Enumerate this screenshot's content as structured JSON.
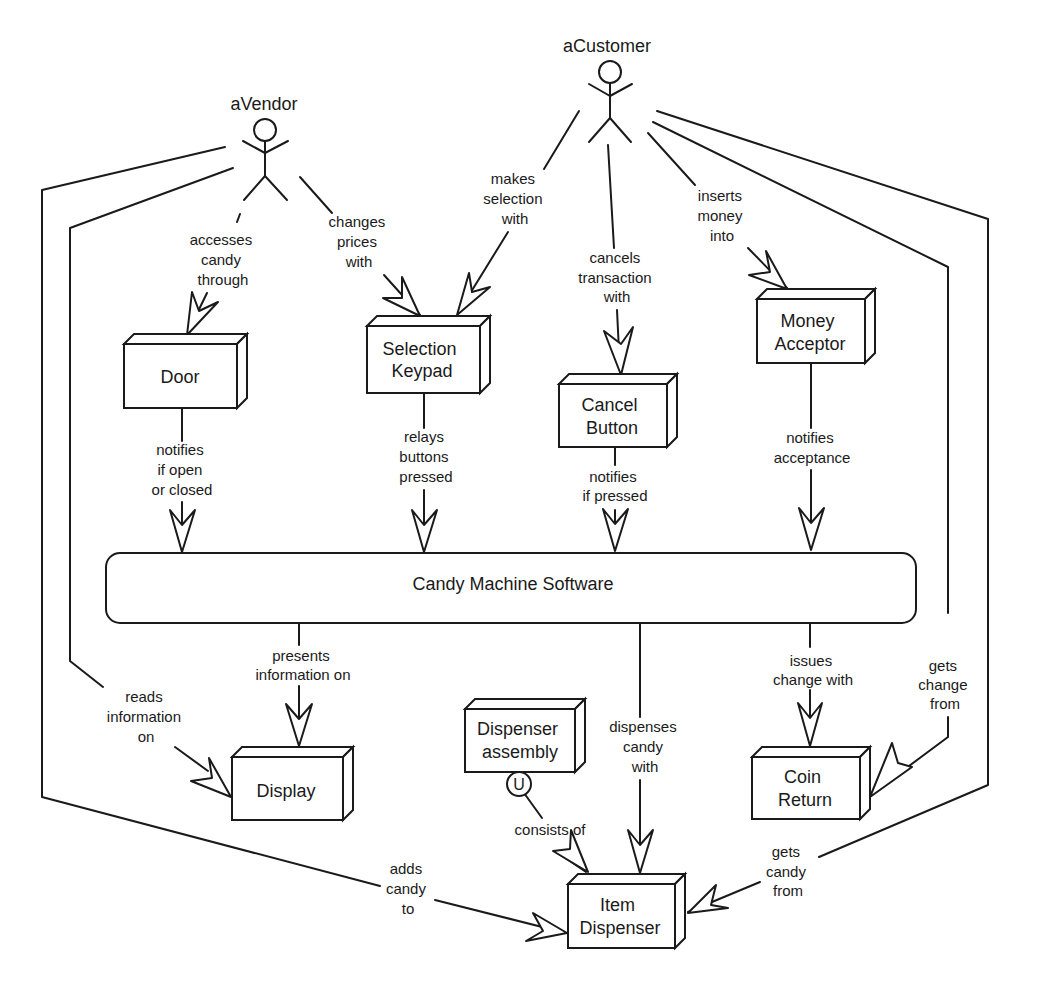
{
  "actors": {
    "vendor": {
      "label": "aVendor"
    },
    "customer": {
      "label": "aCustomer"
    }
  },
  "nodes": {
    "door": {
      "lines": [
        "Door"
      ]
    },
    "keypad": {
      "lines": [
        "Selection",
        "Keypad"
      ]
    },
    "cancel": {
      "lines": [
        "Cancel",
        "Button"
      ]
    },
    "acceptor": {
      "lines": [
        "Money",
        "Acceptor"
      ]
    },
    "software": {
      "lines": [
        "Candy Machine Software"
      ]
    },
    "display": {
      "lines": [
        "Display"
      ]
    },
    "assembly": {
      "lines": [
        "Dispenser",
        "assembly"
      ],
      "badge": "U"
    },
    "coin": {
      "lines": [
        "Coin",
        "Return"
      ]
    },
    "item": {
      "lines": [
        "Item",
        "Dispenser"
      ]
    }
  },
  "edges": {
    "accesses": {
      "lines": [
        "accesses",
        "candy",
        "through"
      ]
    },
    "changes": {
      "lines": [
        "changes",
        "prices",
        "with"
      ]
    },
    "makes": {
      "lines": [
        "makes",
        "selection",
        "with"
      ]
    },
    "cancels": {
      "lines": [
        "cancels",
        "transaction",
        "with"
      ]
    },
    "inserts": {
      "lines": [
        "inserts",
        "money",
        "into"
      ]
    },
    "door_notifies": {
      "lines": [
        "notifies",
        "if open",
        "or closed"
      ]
    },
    "relays": {
      "lines": [
        "relays",
        "buttons",
        "pressed"
      ]
    },
    "cancel_notifies": {
      "lines": [
        "notifies",
        "if pressed"
      ]
    },
    "accept_notifies": {
      "lines": [
        "notifies",
        "acceptance"
      ]
    },
    "presents": {
      "lines": [
        "presents",
        "information on"
      ]
    },
    "reads": {
      "lines": [
        "reads",
        "information",
        "on"
      ]
    },
    "dispenses": {
      "lines": [
        "dispenses",
        "candy",
        "with"
      ]
    },
    "issues": {
      "lines": [
        "issues",
        "change with"
      ]
    },
    "gets_change": {
      "lines": [
        "gets",
        "change",
        "from"
      ]
    },
    "consists": {
      "lines": [
        "consists of"
      ]
    },
    "adds": {
      "lines": [
        "adds",
        "candy",
        "to"
      ]
    },
    "gets_candy": {
      "lines": [
        "gets",
        "candy",
        "from"
      ]
    }
  }
}
